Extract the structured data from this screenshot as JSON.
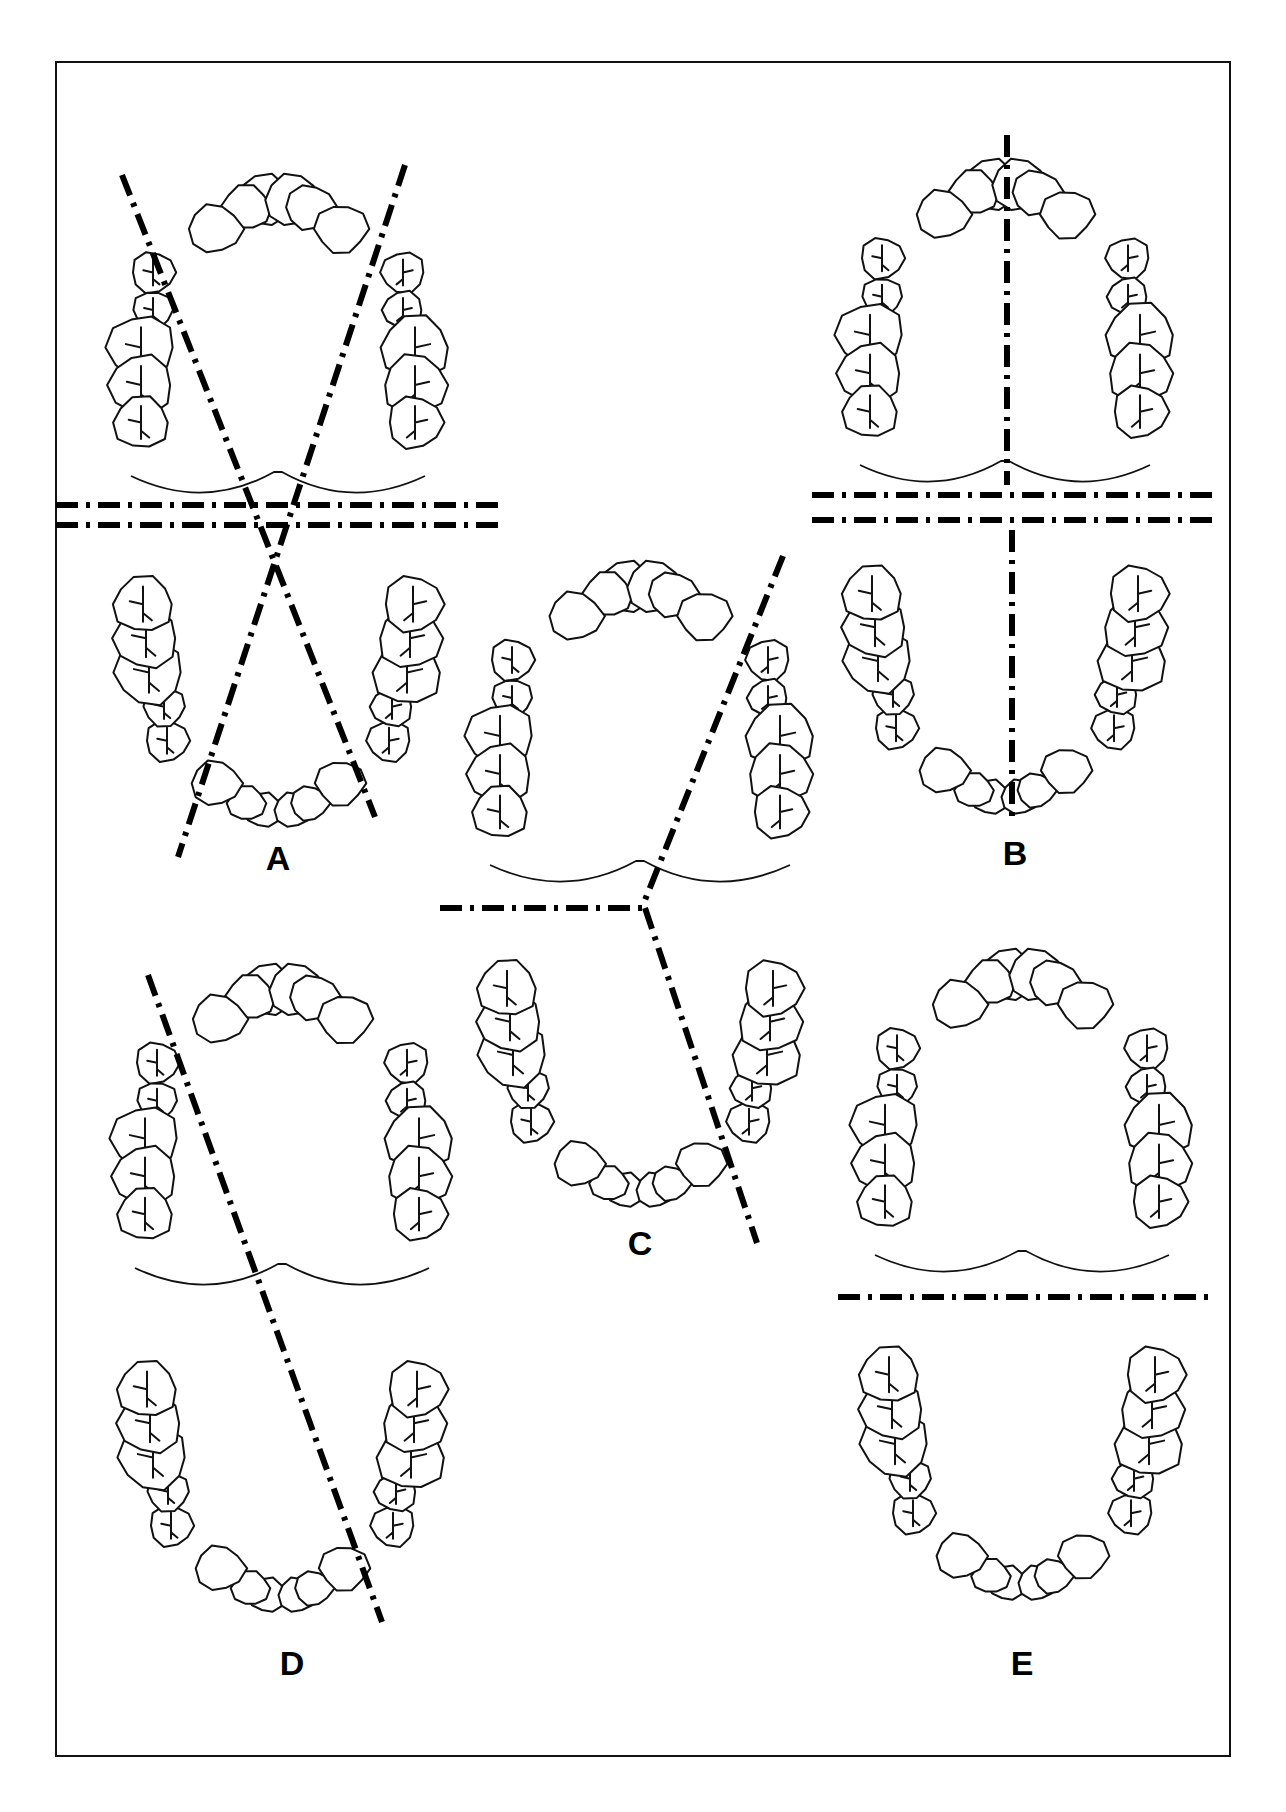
{
  "figure": {
    "frame": {
      "x": 56,
      "y": 62,
      "w": 1174,
      "h": 1694
    },
    "colors": {
      "ink": "#111111",
      "background": "#ffffff"
    },
    "panels": [
      {
        "id": "A",
        "label": "A",
        "label_pos": [
          278,
          870
        ],
        "upper_arch": {
          "cx": 278,
          "top": 175,
          "bottom": 490,
          "half_width": 162,
          "palate_y": 486
        },
        "lower_arch": {
          "cx": 278,
          "top": 540,
          "bottom": 835,
          "half_width": 160
        },
        "cut_lines": [
          {
            "from": [
              122,
              175
            ],
            "to": [
              375,
              817
            ]
          },
          {
            "from": [
              405,
              165
            ],
            "to": [
              178,
              857
            ]
          },
          {
            "from": [
              56,
              505
            ],
            "to": [
              500,
              505
            ]
          },
          {
            "from": [
              56,
              525
            ],
            "to": [
              500,
              525
            ]
          }
        ]
      },
      {
        "id": "B",
        "label": "B",
        "label_pos": [
          1015,
          865
        ],
        "upper_arch": {
          "cx": 1005,
          "top": 160,
          "bottom": 480,
          "half_width": 160,
          "palate_y": 475
        },
        "lower_arch": {
          "cx": 1005,
          "top": 530,
          "bottom": 822,
          "half_width": 158
        },
        "cut_lines": [
          {
            "from": [
              1007,
              135
            ],
            "to": [
              1007,
              485
            ]
          },
          {
            "from": [
              1012,
              530
            ],
            "to": [
              1012,
              822
            ]
          },
          {
            "from": [
              812,
              495
            ],
            "to": [
              1212,
              495
            ]
          },
          {
            "from": [
              812,
              520
            ],
            "to": [
              1212,
              520
            ]
          }
        ]
      },
      {
        "id": "C",
        "label": "C",
        "label_pos": [
          640,
          1255
        ],
        "upper_arch": {
          "cx": 640,
          "top": 562,
          "bottom": 880,
          "half_width": 165,
          "palate_y": 875
        },
        "lower_arch": {
          "cx": 640,
          "top": 925,
          "bottom": 1215,
          "half_width": 158
        },
        "cut_lines": [
          {
            "from": [
              783,
              556
            ],
            "to": [
              643,
              905
            ]
          },
          {
            "from": [
              440,
              908
            ],
            "to": [
              645,
              908
            ]
          },
          {
            "from": [
              645,
              908
            ],
            "to": [
              757,
              1243
            ]
          }
        ]
      },
      {
        "id": "D",
        "label": "D",
        "label_pos": [
          292,
          1675
        ],
        "upper_arch": {
          "cx": 282,
          "top": 965,
          "bottom": 1282,
          "half_width": 162,
          "palate_y": 1278
        },
        "lower_arch": {
          "cx": 282,
          "top": 1325,
          "bottom": 1620,
          "half_width": 160
        },
        "cut_lines": [
          {
            "from": [
              148,
              975
            ],
            "to": [
              382,
              1622
            ]
          }
        ]
      },
      {
        "id": "E",
        "label": "E",
        "label_pos": [
          1022,
          1675
        ],
        "upper_arch": {
          "cx": 1022,
          "top": 950,
          "bottom": 1270,
          "half_width": 162,
          "palate_y": 1265
        },
        "lower_arch": {
          "cx": 1022,
          "top": 1310,
          "bottom": 1608,
          "half_width": 158
        },
        "cut_lines": [
          {
            "from": [
              838,
              1297
            ],
            "to": [
              1212,
              1297
            ]
          }
        ]
      }
    ]
  }
}
